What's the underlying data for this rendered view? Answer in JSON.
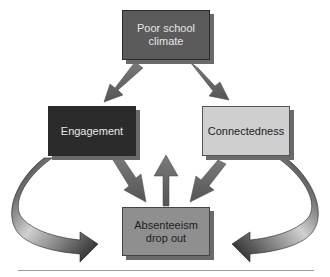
{
  "diagram": {
    "nodes": {
      "top": {
        "label_line1": "Poor school",
        "label_line2": "climate",
        "fill": "#5b5b5b"
      },
      "left": {
        "label": "Engagement",
        "fill": "#2b2b2b"
      },
      "right": {
        "label": "Connectedness",
        "fill": "#cfcfcf"
      },
      "bottom": {
        "label_line1": "Absenteeism",
        "label_line2": "drop out",
        "fill": "#8f8f8f"
      }
    },
    "edges": [
      {
        "from": "Poor school climate",
        "to": "Engagement",
        "style": "straight-arrow"
      },
      {
        "from": "Poor school climate",
        "to": "Connectedness",
        "style": "straight-arrow"
      },
      {
        "from": "Engagement",
        "to": "Absenteeism drop out",
        "style": "straight-arrow"
      },
      {
        "from": "Connectedness",
        "to": "Absenteeism drop out",
        "style": "straight-arrow"
      },
      {
        "from": "Absenteeism drop out",
        "to": "up",
        "style": "straight-arrow"
      },
      {
        "from": "Engagement",
        "to": "Absenteeism drop out",
        "style": "curved-arrow-left"
      },
      {
        "from": "Connectedness",
        "to": "Absenteeism drop out",
        "style": "curved-arrow-right"
      }
    ],
    "arrow_color": "#6e6e6e"
  }
}
